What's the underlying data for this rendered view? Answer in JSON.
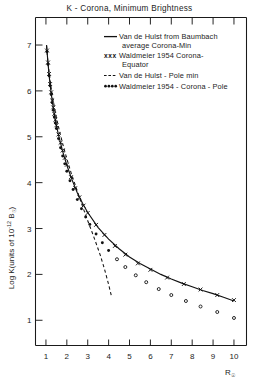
{
  "chart_data": {
    "type": "line",
    "title": "K - Corona, Minimum  Brightness",
    "xlabel": "R☉",
    "ylabel": "Log K(units of 10⁻¹² B☉)",
    "xlim": [
      0.5,
      10.6
    ],
    "ylim": [
      0.45,
      7.6
    ],
    "xticks": [
      1,
      2,
      3,
      4,
      5,
      6,
      7,
      8,
      9,
      10
    ],
    "xtick_labels": [
      "1",
      "2",
      "3",
      "4",
      "5",
      "6",
      "7",
      "8",
      "9",
      "10"
    ],
    "yticks": [
      1,
      2,
      3,
      4,
      5,
      6,
      7
    ],
    "ytick_labels": [
      "1",
      "2",
      "3",
      "4",
      "5",
      "6",
      "7"
    ],
    "grid": false,
    "legend_position": "top-right",
    "series": [
      {
        "name": "Van de Hulst from Baumbach average Corona-Min",
        "style": "solid",
        "marker": "none",
        "color": "#111111",
        "x": [
          1.03,
          1.06,
          1.1,
          1.15,
          1.2,
          1.3,
          1.4,
          1.5,
          1.6,
          1.8,
          2.0,
          2.25,
          2.5,
          2.75,
          3.0,
          3.5,
          4.0,
          4.5,
          5.0,
          5.5,
          6.0,
          6.5,
          7.0,
          7.5,
          8.0,
          8.5,
          9.0,
          9.5,
          10.0
        ],
        "y": [
          7.0,
          6.82,
          6.6,
          6.35,
          6.13,
          5.78,
          5.5,
          5.25,
          5.04,
          4.68,
          4.38,
          4.06,
          3.78,
          3.55,
          3.35,
          3.02,
          2.77,
          2.56,
          2.38,
          2.24,
          2.12,
          2.0,
          1.9,
          1.81,
          1.73,
          1.65,
          1.58,
          1.5,
          1.42
        ]
      },
      {
        "name": "Waldmeier 1954 Corona-Equator",
        "style": "markers",
        "marker": "x",
        "color": "#111111",
        "x": [
          1.05,
          1.1,
          1.15,
          1.2,
          1.25,
          1.3,
          1.35,
          1.4,
          1.45,
          1.5,
          1.6,
          1.7,
          1.8,
          1.9,
          2.0,
          2.2,
          2.4,
          2.6,
          2.8,
          3.0,
          3.4,
          3.8,
          4.3,
          4.8,
          5.4,
          6.0,
          6.8,
          7.6,
          8.4,
          9.2,
          10.0
        ],
        "y": [
          6.88,
          6.62,
          6.37,
          6.15,
          5.97,
          5.79,
          5.64,
          5.5,
          5.37,
          5.25,
          5.05,
          4.87,
          4.7,
          4.54,
          4.39,
          4.12,
          3.88,
          3.68,
          3.5,
          3.34,
          3.08,
          2.86,
          2.62,
          2.43,
          2.24,
          2.1,
          1.93,
          1.79,
          1.67,
          1.55,
          1.44
        ]
      },
      {
        "name": "Van de Hulst - Pole min",
        "style": "dashed",
        "marker": "none",
        "color": "#111111",
        "x": [
          1.03,
          1.08,
          1.15,
          1.25,
          1.35,
          1.5,
          1.65,
          1.8,
          2.0,
          2.2,
          2.4,
          2.6,
          2.8,
          3.0,
          3.2,
          3.4,
          3.6,
          3.8,
          4.0,
          4.15
        ],
        "y": [
          6.98,
          6.7,
          6.4,
          6.06,
          5.78,
          5.42,
          5.12,
          4.85,
          4.52,
          4.22,
          3.95,
          3.68,
          3.42,
          3.17,
          2.93,
          2.68,
          2.42,
          2.12,
          1.78,
          1.5
        ]
      },
      {
        "name": "Waldmeier 1954 - Corona - Pole",
        "style": "markers",
        "marker": "dot",
        "color": "#111111",
        "x": [
          1.05,
          1.1,
          1.15,
          1.2,
          1.25,
          1.3,
          1.35,
          1.4,
          1.45,
          1.5,
          1.6,
          1.7,
          1.8,
          1.9,
          2.0,
          2.15,
          2.3,
          2.5,
          2.7,
          2.9,
          3.1,
          3.4,
          3.7,
          4.0,
          4.4,
          4.8,
          5.3,
          5.8,
          6.4,
          7.0,
          7.7,
          8.4,
          9.2,
          10.0
        ],
        "y": [
          6.86,
          6.58,
          6.33,
          6.11,
          5.92,
          5.74,
          5.58,
          5.43,
          5.3,
          5.18,
          4.96,
          4.76,
          4.58,
          4.41,
          4.25,
          4.04,
          3.85,
          3.63,
          3.43,
          3.25,
          3.09,
          2.88,
          2.69,
          2.52,
          2.33,
          2.16,
          1.98,
          1.83,
          1.68,
          1.55,
          1.42,
          1.3,
          1.18,
          1.05
        ]
      }
    ]
  },
  "legend": {
    "entries": [
      {
        "sample": "solid-line",
        "line1": "Van de Hulst  from  Baumbach",
        "line2": "average  Corona-Min"
      },
      {
        "sample": "x-markers",
        "sample_glyph": "xxx",
        "line1": "Waldmeier  1954  Corona-",
        "line2": "Equator"
      },
      {
        "sample": "dashed-line",
        "line1": "Van de Hulst - Pole  min",
        "line2": ""
      },
      {
        "sample": "dot-markers",
        "line1": "Waldmeier  1954 - Corona - Pole",
        "line2": ""
      }
    ]
  }
}
